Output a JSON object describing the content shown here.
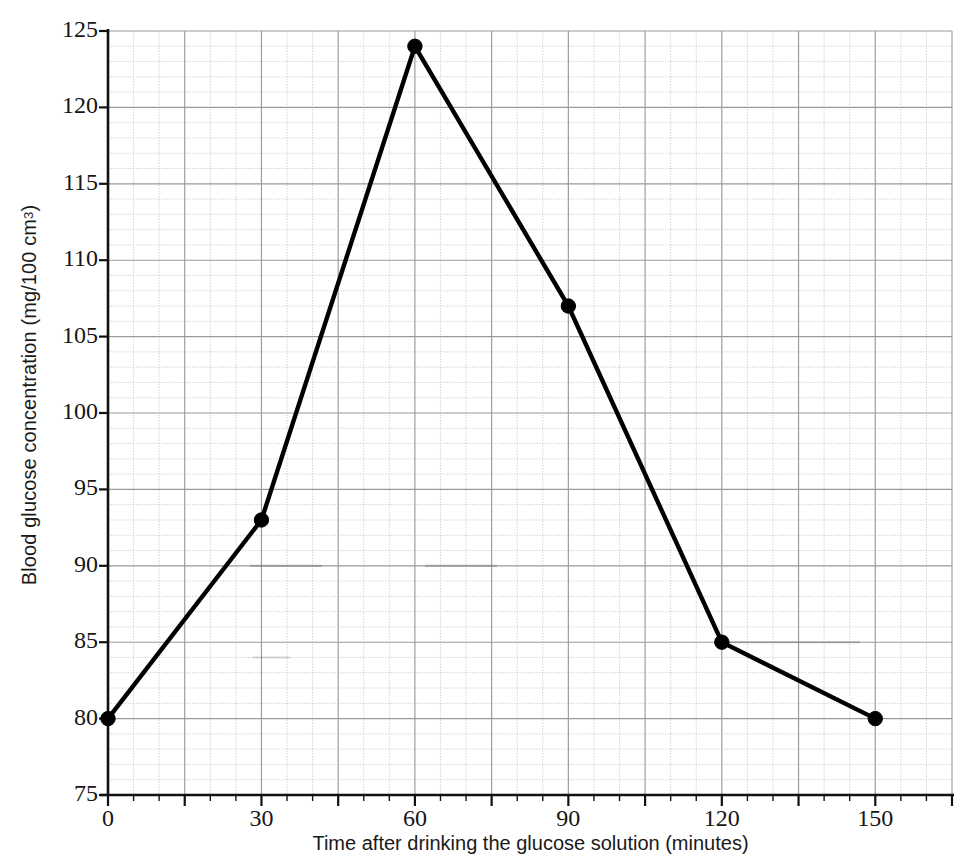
{
  "chart_data": {
    "type": "line",
    "title": "",
    "xlabel": "Time after drinking the glucose solution (minutes)",
    "ylabel": "Blood glucose concentration (mg/100 cm3)",
    "ylabel_parts": {
      "main": "Blood glucose concentration (mg/100 cm",
      "sup": "3",
      "tail": ")"
    },
    "x": [
      0,
      30,
      60,
      90,
      120,
      150
    ],
    "values": [
      80,
      93,
      124,
      107,
      85,
      80
    ],
    "series": [
      {
        "name": "Blood glucose concentration",
        "points": [
          {
            "x": 0,
            "y": 80
          },
          {
            "x": 30,
            "y": 93
          },
          {
            "x": 60,
            "y": 124
          },
          {
            "x": 90,
            "y": 107
          },
          {
            "x": 120,
            "y": 85
          },
          {
            "x": 150,
            "y": 80
          }
        ]
      }
    ],
    "xlim": [
      0,
      165
    ],
    "ylim": [
      75,
      125
    ],
    "xticks": [
      0,
      30,
      60,
      90,
      120,
      150
    ],
    "xtick_labels": [
      "0",
      "30",
      "60",
      "90",
      "120",
      "150"
    ],
    "yticks": [
      75,
      80,
      85,
      90,
      95,
      100,
      105,
      110,
      115,
      120,
      125
    ],
    "ytick_labels": [
      "75",
      "80",
      "85",
      "90",
      "95",
      "100",
      "105",
      "110",
      "115",
      "120",
      "125"
    ],
    "x_minor_step": 5,
    "x_major_step": 15,
    "y_minor_step": 1,
    "y_major_step": 5,
    "grid": true,
    "legend": null,
    "marker": "filled-circle",
    "line_color": "#000000",
    "marker_color": "#000000",
    "grid_major_color": "#9a9a9a",
    "grid_minor_color": "#c3c3c3",
    "axis_color": "#111111",
    "background_color": "#ffffff"
  }
}
